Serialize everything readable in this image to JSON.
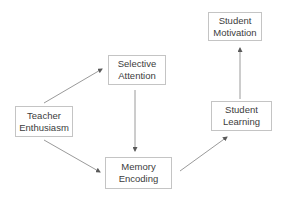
{
  "diagram": {
    "type": "flowchart",
    "colors": {
      "box_border": "#c4c4c4",
      "text": "#3c3c3c",
      "arrow": "#8a8a8a",
      "background": "#ffffff"
    },
    "nodes": [
      {
        "id": "teacher_enthusiasm",
        "line1": "Teacher",
        "line2": "Enthusiasm"
      },
      {
        "id": "selective_attention",
        "line1": "Selective",
        "line2": "Attention"
      },
      {
        "id": "memory_encoding",
        "line1": "Memory",
        "line2": "Encoding"
      },
      {
        "id": "student_learning",
        "line1": "Student",
        "line2": "Learning"
      },
      {
        "id": "student_motivation",
        "line1": "Student",
        "line2": "Motivation"
      }
    ],
    "edges": [
      {
        "from": "teacher_enthusiasm",
        "to": "selective_attention"
      },
      {
        "from": "teacher_enthusiasm",
        "to": "memory_encoding"
      },
      {
        "from": "selective_attention",
        "to": "memory_encoding"
      },
      {
        "from": "memory_encoding",
        "to": "student_learning"
      },
      {
        "from": "student_learning",
        "to": "student_motivation"
      }
    ]
  }
}
